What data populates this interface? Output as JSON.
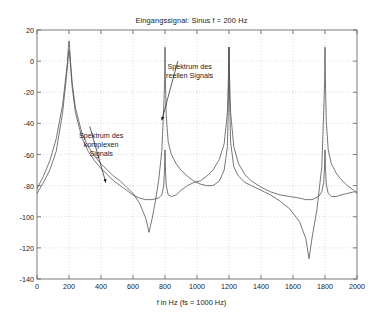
{
  "chart_data": {
    "type": "line",
    "title": "Eingangssignal: Sinus f = 200 Hz",
    "xlabel": "f in Hz (fs = 1000 Hz)",
    "ylabel": "",
    "xlim": [
      0,
      2000
    ],
    "ylim": [
      -140,
      20
    ],
    "xticks": [
      0,
      200,
      400,
      600,
      800,
      1000,
      1200,
      1400,
      1600,
      1800,
      2000
    ],
    "yticks": [
      20,
      0,
      -20,
      -40,
      -60,
      -80,
      -100,
      -120,
      -140
    ],
    "grid": true,
    "legend_position": "none",
    "annotations": [
      {
        "id": "komplex",
        "text_lines": [
          "Spektrum des",
          "komplexen",
          "Signals"
        ],
        "text": "Spektrum des komplexen Signals",
        "x": 330,
        "y": -42,
        "arrow_to_x": 430,
        "arrow_to_y": -78
      },
      {
        "id": "reell",
        "text_lines": [
          "Spektrum des",
          "reellen Signals"
        ],
        "text": "Spektrum des reellen Signals",
        "x": 880,
        "y": 0,
        "arrow_to_x": 780,
        "arrow_to_y": -38
      }
    ],
    "series": [
      {
        "name": "Spektrum des reellen Signals",
        "color": "#4a4a4a",
        "peaks_hz": [
          200,
          800,
          1200,
          1800
        ],
        "peak_values_db": [
          13,
          9,
          9,
          9
        ],
        "x": [
          0,
          40,
          80,
          120,
          160,
          180,
          190,
          196,
          200,
          204,
          210,
          220,
          240,
          280,
          320,
          360,
          400,
          440,
          480,
          520,
          560,
          600,
          640,
          680,
          700,
          720,
          740,
          760,
          780,
          792,
          798,
          800,
          802,
          808,
          820,
          840,
          870,
          900,
          940,
          980,
          1020,
          1060,
          1100,
          1140,
          1170,
          1190,
          1196,
          1200,
          1204,
          1210,
          1230,
          1260,
          1300,
          1340,
          1400,
          1460,
          1520,
          1580,
          1640,
          1680,
          1700,
          1720,
          1750,
          1780,
          1792,
          1798,
          1800,
          1802,
          1808,
          1820,
          1840,
          1870,
          1900,
          1940,
          1980,
          2000
        ],
        "y": [
          -82,
          -74,
          -64,
          -50,
          -28,
          -10,
          -1,
          9,
          13,
          9,
          -1,
          -14,
          -30,
          -46,
          -55,
          -61,
          -66,
          -70,
          -74,
          -77,
          -81,
          -85,
          -91,
          -101,
          -110,
          -101,
          -90,
          -77,
          -58,
          -30,
          -12,
          9,
          -10,
          -35,
          -52,
          -60,
          -66,
          -70,
          -74,
          -77,
          -79,
          -80,
          -80,
          -77,
          -70,
          -55,
          -28,
          9,
          -25,
          -52,
          -68,
          -74,
          -78,
          -80,
          -83,
          -86,
          -90,
          -95,
          -103,
          -114,
          -127,
          -113,
          -95,
          -68,
          -32,
          -12,
          9,
          -10,
          -38,
          -57,
          -66,
          -72,
          -76,
          -80,
          -83,
          -85
        ]
      },
      {
        "name": "Spektrum des komplexen Signals",
        "color": "#4a4a4a",
        "peaks_hz": [
          200,
          800,
          1200,
          1800
        ],
        "peak_values_db": [
          7,
          -57,
          9,
          -57
        ],
        "x": [
          0,
          40,
          80,
          120,
          160,
          180,
          190,
          196,
          200,
          204,
          210,
          220,
          240,
          280,
          320,
          360,
          400,
          440,
          480,
          520,
          560,
          600,
          640,
          680,
          720,
          760,
          780,
          792,
          797,
          800,
          803,
          808,
          820,
          840,
          870,
          900,
          940,
          980,
          1020,
          1060,
          1100,
          1140,
          1170,
          1190,
          1196,
          1200,
          1204,
          1210,
          1230,
          1260,
          1300,
          1340,
          1400,
          1460,
          1520,
          1580,
          1640,
          1680,
          1720,
          1760,
          1780,
          1792,
          1797,
          1800,
          1803,
          1808,
          1820,
          1840,
          1870,
          1900,
          1940,
          1980,
          2000
        ],
        "y": [
          -85,
          -78,
          -70,
          -58,
          -33,
          -14,
          -4,
          4,
          7,
          4,
          -4,
          -17,
          -33,
          -49,
          -58,
          -64,
          -69,
          -73,
          -77,
          -80,
          -83,
          -86,
          -88,
          -89,
          -89,
          -88,
          -86,
          -80,
          -70,
          -57,
          -70,
          -80,
          -86,
          -87,
          -86,
          -83,
          -80,
          -78,
          -77,
          -74,
          -70,
          -63,
          -53,
          -33,
          -11,
          9,
          -12,
          -33,
          -55,
          -66,
          -73,
          -77,
          -81,
          -84,
          -86,
          -87,
          -88,
          -89,
          -89,
          -87,
          -84,
          -78,
          -68,
          -57,
          -69,
          -79,
          -85,
          -87,
          -87,
          -86,
          -85,
          -84,
          -84
        ]
      }
    ]
  }
}
